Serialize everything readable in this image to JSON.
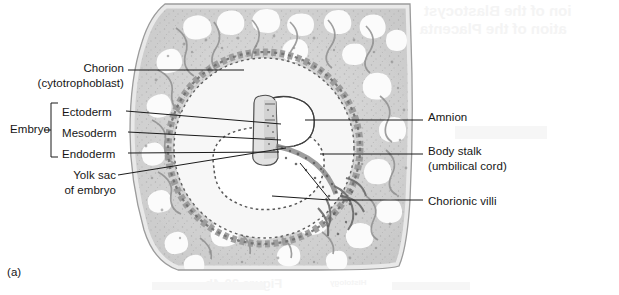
{
  "figure": {
    "panel_label": "(a)",
    "caption_visible": false
  },
  "labels": {
    "left": [
      {
        "name": "chorion",
        "lines": [
          "Chorion",
          "(cytotrophoblast)"
        ],
        "line1": "Chorion",
        "line2": "(cytotrophoblast)"
      },
      {
        "name": "yolk-sac",
        "lines": [
          "Yolk sac",
          "of embryo"
        ],
        "line1": "Yolk sac",
        "line2": "of embryo"
      }
    ],
    "bracket": {
      "group_label": "Embryo",
      "items": [
        {
          "name": "ectoderm",
          "label": "Ectoderm"
        },
        {
          "name": "mesoderm",
          "label": "Mesoderm"
        },
        {
          "name": "endoderm",
          "label": "Endoderm"
        }
      ]
    },
    "right": [
      {
        "name": "amnion",
        "line1": "Amnion",
        "line2": ""
      },
      {
        "name": "body-stalk",
        "line1": "Body stalk",
        "line2": "(umbilical cord)"
      },
      {
        "name": "chorionic-villi",
        "line1": "Chorionic villi",
        "line2": ""
      }
    ]
  },
  "bleedthrough": {
    "note": "faint mirrored text showing through from reverse of printed page",
    "line1": "ion of the Blastocyst",
    "line2": "ation of the Placenta",
    "line3": "Figure 30-4b",
    "line4": "Histology"
  },
  "colors": {
    "ink": "#161616",
    "leader": "#1b1b1b",
    "page_background": "#ffffff",
    "tissue_light": "#e8e8e8",
    "tissue_mid": "#cfcfcf",
    "tissue_dark": "#a9a9a9",
    "lacuna_white": "#fbfbfb",
    "bleed_text": "#f4f4f4"
  },
  "specimen": {
    "type": "histological-section",
    "subject": "implanted blastocyst in uterine endometrium",
    "stain": "grayscale halftone"
  }
}
